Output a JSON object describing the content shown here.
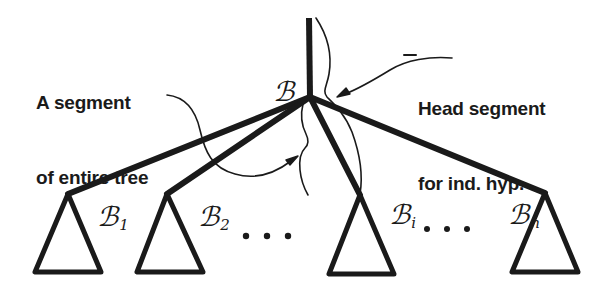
{
  "figure": {
    "kind": "tree-diagram",
    "background_color": "#ffffff",
    "ink_color": "#1a1a1a",
    "annotations": {
      "left": {
        "name": "a-segment-of-entire-tree",
        "line1": "A segment",
        "line2": "of entire tree"
      },
      "right": {
        "name": "head-segment-for-ind-hyp",
        "line1": "Head segment",
        "line2": "for ind. hyp."
      }
    },
    "nodes": {
      "root": {
        "base": "ℬ",
        "sub": ""
      },
      "child1": {
        "base": "ℬ",
        "sub": "1"
      },
      "child2": {
        "base": "ℬ",
        "sub": "2"
      },
      "childi": {
        "base": "ℬ",
        "sub": "i"
      },
      "childn": {
        "base": "ℬ",
        "sub": "n"
      }
    },
    "ellipses": {
      "between_2_and_i": "• • •",
      "between_i_and_n": "• • •"
    }
  }
}
